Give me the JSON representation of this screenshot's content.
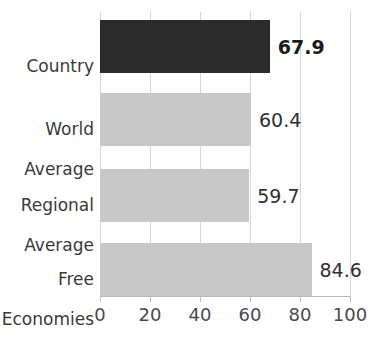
{
  "chart_data": {
    "type": "bar",
    "orientation": "horizontal",
    "title": "",
    "xlabel": "",
    "ylabel": "",
    "xlim": [
      0,
      100
    ],
    "xticks": [
      0,
      20,
      40,
      60,
      80,
      100
    ],
    "xtick_labels": [
      "0",
      "20",
      "40",
      "60",
      "80",
      "100"
    ],
    "grid": true,
    "legend": "none",
    "categories": [
      "Country",
      "World Average",
      "Regional Average",
      "Free Economies"
    ],
    "values": [
      67.9,
      60.4,
      59.7,
      84.6
    ],
    "value_labels": [
      "67.9",
      "60.4",
      "59.7",
      "84.6"
    ],
    "bars": [
      {
        "category": "Country",
        "category_line1": "Country",
        "category_line2": "",
        "value": 67.9,
        "value_label": "67.9",
        "color": "#2b2b2b",
        "highlight": true
      },
      {
        "category": "World Average",
        "category_line1": "World",
        "category_line2": "Average",
        "value": 60.4,
        "value_label": "60.4",
        "color": "#c8c8c8",
        "highlight": false
      },
      {
        "category": "Regional Average",
        "category_line1": "Regional",
        "category_line2": "Average",
        "value": 59.7,
        "value_label": "59.7",
        "color": "#c8c8c8",
        "highlight": false
      },
      {
        "category": "Free Economies",
        "category_line1": "Free",
        "category_line2": "Economies",
        "value": 84.6,
        "value_label": "84.6",
        "color": "#c8c8c8",
        "highlight": false
      }
    ],
    "colors": {
      "highlight_bar": "#2b2b2b",
      "default_bar": "#c8c8c8",
      "gridline": "#d6d6d6",
      "axis": "#b8b8b8",
      "text": "#3a3a3a",
      "background": "#ffffff"
    }
  }
}
